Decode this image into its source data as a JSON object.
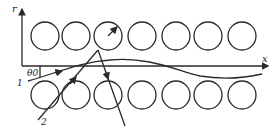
{
  "diagram": {
    "axes": {
      "vertical_label": "r",
      "horizontal_label": "x"
    },
    "angle_label": "θ0",
    "ray_labels": [
      "1",
      "2"
    ],
    "top_row_circles": 7,
    "bottom_row_circles": 7,
    "colors": {
      "stroke": "#2a2a2a",
      "background": "#ffffff"
    }
  }
}
